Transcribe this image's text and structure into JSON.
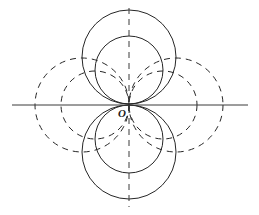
{
  "figure": {
    "kind": "geometric-diagram",
    "background_color": "#ffffff",
    "stroke_color": "#262626",
    "axis_color": "#3a3a3a",
    "stroke_width": 1,
    "width": 259,
    "height": 215
  },
  "origin": {
    "label": "O",
    "x": 129,
    "y": 105,
    "label_x": 118,
    "label_y": 108
  },
  "axes": {
    "horizontal": {
      "name": "x-axis",
      "style": "solid",
      "x1": 12,
      "y1": 105,
      "x2": 248,
      "y2": 105
    },
    "vertical": {
      "name": "y-axis",
      "style": "dashed",
      "x1": 129,
      "y1": 8,
      "x2": 129,
      "y2": 207,
      "dash": "6 5"
    }
  },
  "circles": [
    {
      "name": "circle-top-outer",
      "orientation": "vertical",
      "style": "solid",
      "cx": 129,
      "cy": 57,
      "r": 47
    },
    {
      "name": "circle-top-inner",
      "orientation": "vertical",
      "style": "solid",
      "cx": 129,
      "cy": 70,
      "r": 34
    },
    {
      "name": "circle-bottom-outer",
      "orientation": "vertical",
      "style": "solid",
      "cx": 129,
      "cy": 152,
      "r": 47
    },
    {
      "name": "circle-bottom-inner",
      "orientation": "vertical",
      "style": "solid",
      "cx": 129,
      "cy": 139,
      "r": 34
    },
    {
      "name": "circle-left-outer",
      "orientation": "horizontal",
      "style": "dashed",
      "cx": 82,
      "cy": 105,
      "r": 47,
      "dash": "6 5"
    },
    {
      "name": "circle-left-inner",
      "orientation": "horizontal",
      "style": "dashed",
      "cx": 95,
      "cy": 105,
      "r": 34,
      "dash": "6 5"
    },
    {
      "name": "circle-right-outer",
      "orientation": "horizontal",
      "style": "dashed",
      "cx": 176,
      "cy": 105,
      "r": 47,
      "dash": "6 5"
    },
    {
      "name": "circle-right-inner",
      "orientation": "horizontal",
      "style": "dashed",
      "cx": 163,
      "cy": 105,
      "r": 34,
      "dash": "6 5"
    }
  ]
}
